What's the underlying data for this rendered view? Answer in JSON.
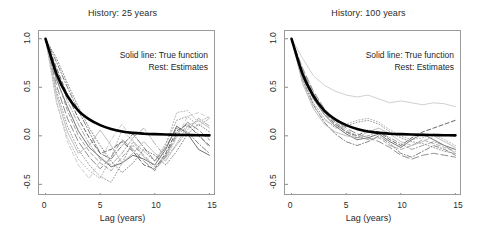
{
  "figure": {
    "background": "#ffffff",
    "axis_color": "#6d6d6d",
    "true_curve_color": "#000000"
  },
  "panels": [
    {
      "id": "history-25",
      "title": "History: 25 years",
      "annotation_line1": "Solid line: True function",
      "annotation_line2": "Rest: Estimates"
    },
    {
      "id": "history-100",
      "title": "History: 100 years",
      "annotation_line1": "Solid line: True function",
      "annotation_line2": "Rest: Estimates"
    }
  ],
  "axes": {
    "xlabel": "Lag (years)",
    "xticks": [
      "0",
      "5",
      "10",
      "15"
    ],
    "yticks": [
      "1.0",
      "0.5",
      "0.0",
      "-0.5"
    ]
  },
  "chart_data": {
    "type": "line",
    "xlabel": "Lag (years)",
    "ylabel": "",
    "xlim": [
      -0.6,
      15.6
    ],
    "ylim": [
      -0.62,
      1.08
    ],
    "xticks": [
      0,
      5,
      10,
      15
    ],
    "yticks": [
      -0.5,
      0.0,
      0.5,
      1.0
    ],
    "grid": false,
    "legend": {
      "position": "upper-right-inside",
      "entries": [
        "Solid line: True function",
        "Rest: Estimates"
      ]
    },
    "panels": [
      {
        "name": "History: 25 years",
        "x": [
          0,
          1,
          2,
          3,
          4,
          5,
          6,
          7,
          8,
          9,
          10,
          11,
          12,
          13,
          14,
          15
        ],
        "series": [
          {
            "name": "True function",
            "style": "solid",
            "width": 2.6,
            "color": "#000000",
            "values": [
              1.0,
              0.64,
              0.41,
              0.26,
              0.17,
              0.11,
              0.07,
              0.045,
              0.03,
              0.022,
              0.017,
              0.013,
              0.01,
              0.008,
              0.006,
              0.005
            ]
          },
          {
            "name": "Estimate 1",
            "style": "solid",
            "color": "#5a5a5a",
            "values": [
              1.0,
              0.58,
              0.3,
              0.05,
              -0.12,
              -0.22,
              -0.32,
              -0.28,
              -0.2,
              -0.24,
              -0.3,
              -0.14,
              0.1,
              0.02,
              -0.14,
              -0.2
            ]
          },
          {
            "name": "Estimate 2",
            "style": "dashed",
            "color": "#4a4a4a",
            "values": [
              1.0,
              0.7,
              0.42,
              0.18,
              -0.02,
              -0.18,
              -0.14,
              -0.06,
              -0.16,
              -0.3,
              -0.34,
              -0.18,
              0.05,
              0.12,
              0.0,
              -0.1
            ]
          },
          {
            "name": "Estimate 3",
            "style": "dotted",
            "color": "#8a8a8a",
            "values": [
              1.0,
              0.46,
              0.1,
              -0.14,
              -0.3,
              -0.42,
              -0.48,
              -0.28,
              -0.06,
              -0.16,
              -0.26,
              -0.08,
              0.16,
              0.2,
              0.1,
              0.18
            ]
          },
          {
            "name": "Estimate 4",
            "style": "dashdot",
            "color": "#666666",
            "values": [
              1.0,
              0.76,
              0.5,
              0.26,
              0.04,
              -0.18,
              -0.24,
              -0.1,
              0.02,
              -0.12,
              -0.26,
              -0.12,
              0.08,
              0.04,
              -0.08,
              -0.18
            ]
          },
          {
            "name": "Estimate 5",
            "style": "longdash",
            "color": "#777777",
            "values": [
              1.0,
              0.52,
              0.18,
              -0.06,
              -0.22,
              -0.34,
              -0.22,
              -0.04,
              -0.14,
              -0.26,
              -0.36,
              -0.2,
              0.02,
              0.14,
              0.06,
              -0.04
            ]
          },
          {
            "name": "Estimate 6",
            "style": "dotted",
            "color": "#a8a8a8",
            "values": [
              1.0,
              0.34,
              -0.02,
              -0.24,
              -0.36,
              -0.44,
              -0.22,
              0.06,
              -0.06,
              -0.22,
              -0.3,
              -0.1,
              0.24,
              0.26,
              0.14,
              0.2
            ]
          },
          {
            "name": "Estimate 7",
            "style": "dashed",
            "color": "#909090",
            "values": [
              1.0,
              0.6,
              0.26,
              0.0,
              -0.16,
              -0.28,
              -0.36,
              -0.22,
              -0.1,
              -0.2,
              -0.32,
              -0.22,
              0.0,
              0.1,
              0.02,
              -0.12
            ]
          },
          {
            "name": "Estimate 8",
            "style": "solid",
            "color": "#b4b4b4",
            "values": [
              1.0,
              0.42,
              0.04,
              -0.18,
              -0.1,
              0.06,
              -0.1,
              -0.28,
              -0.18,
              -0.06,
              -0.18,
              -0.26,
              -0.08,
              0.1,
              0.16,
              0.08
            ]
          },
          {
            "name": "Estimate 9",
            "style": "dashdot",
            "color": "#9c9c9c",
            "values": [
              1.0,
              0.68,
              0.36,
              0.12,
              -0.08,
              -0.24,
              -0.3,
              -0.18,
              -0.02,
              0.08,
              -0.08,
              -0.22,
              -0.1,
              0.06,
              0.18,
              0.1
            ]
          },
          {
            "name": "Estimate 10",
            "style": "dashed",
            "color": "#c4c4c4",
            "values": [
              1.0,
              0.36,
              -0.06,
              -0.3,
              -0.44,
              -0.26,
              -0.04,
              0.12,
              -0.04,
              -0.22,
              -0.34,
              -0.24,
              -0.02,
              0.2,
              0.24,
              0.18
            ]
          },
          {
            "name": "Estimate 11",
            "style": "dotted",
            "color": "#707070",
            "values": [
              1.0,
              0.8,
              0.54,
              0.3,
              0.08,
              -0.1,
              -0.26,
              -0.38,
              -0.28,
              -0.14,
              -0.2,
              -0.3,
              -0.16,
              0.02,
              0.12,
              0.04
            ]
          }
        ]
      },
      {
        "name": "History: 100 years",
        "x": [
          0,
          1,
          2,
          3,
          4,
          5,
          6,
          7,
          8,
          9,
          10,
          11,
          12,
          13,
          14,
          15
        ],
        "series": [
          {
            "name": "True function",
            "style": "solid",
            "width": 2.6,
            "color": "#000000",
            "values": [
              1.0,
              0.64,
              0.41,
              0.26,
              0.17,
              0.11,
              0.07,
              0.045,
              0.03,
              0.022,
              0.017,
              0.013,
              0.01,
              0.008,
              0.006,
              0.005
            ]
          },
          {
            "name": "Estimate 1",
            "style": "solid",
            "color": "#c8c8c8",
            "values": [
              1.0,
              0.8,
              0.62,
              0.52,
              0.46,
              0.42,
              0.4,
              0.42,
              0.38,
              0.34,
              0.36,
              0.34,
              0.32,
              0.34,
              0.33,
              0.3
            ]
          },
          {
            "name": "Estimate 2",
            "style": "solid",
            "color": "#5a5a5a",
            "values": [
              1.0,
              0.62,
              0.38,
              0.22,
              0.1,
              0.02,
              -0.04,
              -0.02,
              0.02,
              -0.06,
              -0.12,
              -0.04,
              0.02,
              -0.04,
              -0.1,
              -0.14
            ]
          },
          {
            "name": "Estimate 3",
            "style": "dashed",
            "color": "#4a4a4a",
            "values": [
              1.0,
              0.66,
              0.42,
              0.24,
              0.12,
              0.04,
              0.0,
              0.06,
              0.04,
              -0.04,
              -0.1,
              -0.02,
              0.04,
              0.08,
              0.12,
              0.16
            ]
          },
          {
            "name": "Estimate 4",
            "style": "dotted",
            "color": "#8a8a8a",
            "values": [
              1.0,
              0.6,
              0.34,
              0.18,
              0.08,
              0.1,
              0.14,
              0.16,
              0.12,
              0.04,
              -0.02,
              -0.06,
              -0.08,
              -0.12,
              -0.16,
              -0.18
            ]
          },
          {
            "name": "Estimate 5",
            "style": "dashdot",
            "color": "#707070",
            "values": [
              1.0,
              0.58,
              0.32,
              0.14,
              0.02,
              -0.06,
              -0.1,
              -0.06,
              0.0,
              -0.08,
              -0.18,
              -0.22,
              -0.16,
              -0.1,
              -0.14,
              -0.2
            ]
          },
          {
            "name": "Estimate 6",
            "style": "longdash",
            "color": "#7d7d7d",
            "values": [
              1.0,
              0.7,
              0.46,
              0.28,
              0.16,
              0.08,
              0.02,
              -0.02,
              -0.06,
              -0.12,
              -0.2,
              -0.24,
              -0.2,
              -0.18,
              -0.2,
              -0.22
            ]
          },
          {
            "name": "Estimate 7",
            "style": "dotted",
            "color": "#a8a8a8",
            "values": [
              1.0,
              0.56,
              0.3,
              0.16,
              0.1,
              0.12,
              0.16,
              0.18,
              0.14,
              0.06,
              0.0,
              -0.04,
              -0.02,
              0.02,
              -0.04,
              -0.1
            ]
          },
          {
            "name": "Estimate 8",
            "style": "dashed",
            "color": "#9c9c9c",
            "values": [
              1.0,
              0.64,
              0.4,
              0.24,
              0.14,
              0.06,
              0.0,
              -0.04,
              -0.02,
              -0.1,
              -0.14,
              -0.1,
              -0.04,
              -0.08,
              -0.12,
              -0.16
            ]
          },
          {
            "name": "Estimate 9",
            "style": "solid",
            "color": "#b4b4b4",
            "values": [
              1.0,
              0.54,
              0.28,
              0.12,
              0.04,
              0.0,
              -0.02,
              0.04,
              0.08,
              0.02,
              -0.06,
              -0.1,
              -0.06,
              0.0,
              -0.06,
              -0.12
            ]
          },
          {
            "name": "Estimate 10",
            "style": "dashdot",
            "color": "#909090",
            "values": [
              1.0,
              0.68,
              0.44,
              0.26,
              0.14,
              0.04,
              -0.02,
              0.0,
              0.04,
              -0.02,
              -0.08,
              -0.14,
              -0.1,
              -0.06,
              -0.1,
              -0.18
            ]
          }
        ]
      }
    ]
  }
}
